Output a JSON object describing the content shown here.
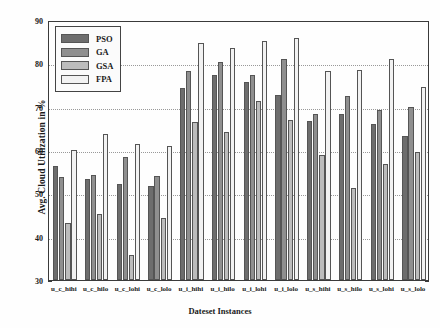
{
  "chart_data": {
    "type": "bar",
    "title": "",
    "xlabel": "Dateset Instances",
    "ylabel": "Avg. Cloud Utilization in %",
    "ylim": [
      30,
      90
    ],
    "yticks": [
      30,
      40,
      50,
      60,
      70,
      80,
      90
    ],
    "grid": true,
    "legend_position": "upper left",
    "categories": [
      "u_c_hihi",
      "u_c_hilo",
      "u_c_lohi",
      "u_c_lolo",
      "u_i_hihi",
      "u_i_hilo",
      "u_i_lohi",
      "u_i_lolo",
      "u_s_hihi",
      "u_s_hilo",
      "u_s_lohi",
      "u_s_lolo"
    ],
    "series": [
      {
        "name": "PSO",
        "color": "#6d6d6d",
        "values": [
          56.3,
          53.2,
          52.2,
          51.6,
          74.2,
          77.2,
          75.7,
          72.7,
          66.7,
          68.3,
          65.9,
          63.3
        ]
      },
      {
        "name": "GA",
        "color": "#8f8f8f",
        "values": [
          53.7,
          54.2,
          58.4,
          54.1,
          78.3,
          80.4,
          77.3,
          81.1,
          68.3,
          72.4,
          69.3,
          70.0
        ]
      },
      {
        "name": "GSA",
        "color": "#bcbcbc",
        "values": [
          43.2,
          45.3,
          35.7,
          44.3,
          66.4,
          64.2,
          71.3,
          67.0,
          58.8,
          51.3,
          56.8,
          59.6
        ]
      },
      {
        "name": "FPA",
        "color": "#f2f2f2",
        "values": [
          60.1,
          63.8,
          61.4,
          61.0,
          84.6,
          83.6,
          85.2,
          85.8,
          78.2,
          78.4,
          81.1,
          74.6
        ]
      }
    ]
  }
}
